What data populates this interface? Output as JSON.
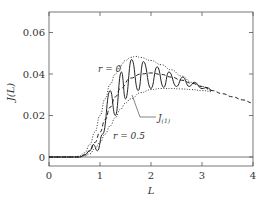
{
  "chart_data": {
    "type": "line",
    "title": "",
    "xlabel": "L",
    "ylabel": "J(L)",
    "xlim": [
      0,
      4
    ],
    "ylim": [
      -0.002,
      0.068
    ],
    "xticks": [
      "0",
      "1",
      "2",
      "3",
      "4"
    ],
    "yticks": [
      "0",
      "0.02",
      "0.04",
      "0.06"
    ],
    "grid": false,
    "annotations": [
      "r = 0",
      "r = 0.5",
      "J(1)"
    ],
    "series": [
      {
        "name": "r = 0 (upper envelope)",
        "style": "dotted",
        "x": [
          0,
          0.5,
          0.6,
          0.7,
          0.8,
          0.9,
          1.0,
          1.1,
          1.2,
          1.3,
          1.4,
          1.5,
          1.6,
          1.7,
          1.8,
          2.0,
          2.2,
          2.4,
          2.6,
          2.8,
          3.0,
          3.2
        ],
        "y": [
          0,
          0,
          0.0005,
          0.002,
          0.006,
          0.012,
          0.02,
          0.028,
          0.035,
          0.04,
          0.044,
          0.0465,
          0.048,
          0.0485,
          0.048,
          0.0465,
          0.0445,
          0.042,
          0.039,
          0.036,
          0.034,
          0.032
        ]
      },
      {
        "name": "r = 0.5 (lower envelope)",
        "style": "dotted",
        "x": [
          0,
          0.6,
          0.7,
          0.8,
          0.9,
          1.0,
          1.1,
          1.2,
          1.3,
          1.4,
          1.5,
          1.6,
          1.8,
          2.0,
          2.2,
          2.4,
          2.6,
          2.8,
          3.0,
          3.2
        ],
        "y": [
          0,
          0,
          0.0005,
          0.0015,
          0.004,
          0.007,
          0.011,
          0.015,
          0.019,
          0.023,
          0.026,
          0.028,
          0.031,
          0.0325,
          0.033,
          0.033,
          0.0328,
          0.0325,
          0.032,
          0.0315
        ]
      },
      {
        "name": "mean (dashed)",
        "style": "dashed",
        "x": [
          0,
          0.6,
          0.7,
          0.8,
          0.9,
          1.0,
          1.1,
          1.2,
          1.3,
          1.4,
          1.6,
          1.8,
          2.0,
          2.2,
          2.4,
          2.6,
          2.8,
          3.0,
          3.2,
          3.4,
          3.6,
          3.8,
          4.0
        ],
        "y": [
          0,
          0,
          0.001,
          0.003,
          0.007,
          0.012,
          0.018,
          0.024,
          0.029,
          0.033,
          0.038,
          0.04,
          0.0405,
          0.0398,
          0.0385,
          0.037,
          0.0355,
          0.034,
          0.032,
          0.0305,
          0.029,
          0.0275,
          0.026
        ]
      },
      {
        "name": "J(1) (oscillating)",
        "style": "solid",
        "x": [
          0,
          0.6,
          0.7,
          0.8,
          0.87,
          0.95,
          1.05,
          1.2,
          1.3,
          1.42,
          1.5,
          1.62,
          1.75,
          1.85,
          2.0,
          2.12,
          2.25,
          2.35,
          2.5,
          2.62,
          2.75,
          2.85,
          3.0,
          3.1,
          3.2
        ],
        "y": [
          0,
          0,
          0.001,
          0.003,
          0.006,
          0.003,
          0.011,
          0.032,
          0.02,
          0.041,
          0.028,
          0.047,
          0.032,
          0.046,
          0.033,
          0.0435,
          0.0335,
          0.041,
          0.034,
          0.0385,
          0.034,
          0.036,
          0.033,
          0.0335,
          0.032
        ]
      }
    ]
  }
}
